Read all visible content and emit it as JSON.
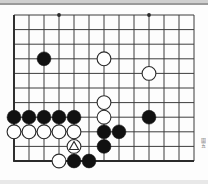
{
  "board": {
    "title": "Go board diagram",
    "type": "go-board-position",
    "cols": 13,
    "rows": 11,
    "origin_x": 14,
    "origin_y": 9,
    "spacing_x": 15,
    "spacing_y": 14.6,
    "bottom_edge_row": 10,
    "line_color": "#3d3d3d",
    "edge_color": "#2b2b2b",
    "black_color": "#111111",
    "white_color": "#ffffff",
    "white_border": "#2b2b2b",
    "board_color": "#fdfdfd",
    "star_points": [
      {
        "col": 3,
        "row": 0
      },
      {
        "col": 9,
        "row": 0
      }
    ],
    "stones": [
      {
        "col": 2,
        "row": 3,
        "color": "black",
        "mark": ""
      },
      {
        "col": 6,
        "row": 3,
        "color": "white",
        "mark": ""
      },
      {
        "col": 9,
        "row": 4,
        "color": "white",
        "mark": ""
      },
      {
        "col": 6,
        "row": 6,
        "color": "white",
        "mark": ""
      },
      {
        "col": 0,
        "row": 7,
        "color": "black",
        "mark": ""
      },
      {
        "col": 1,
        "row": 7,
        "color": "black",
        "mark": ""
      },
      {
        "col": 2,
        "row": 7,
        "color": "black",
        "mark": ""
      },
      {
        "col": 3,
        "row": 7,
        "color": "black",
        "mark": ""
      },
      {
        "col": 4,
        "row": 7,
        "color": "black",
        "mark": ""
      },
      {
        "col": 6,
        "row": 7,
        "color": "white",
        "mark": ""
      },
      {
        "col": 9,
        "row": 7,
        "color": "black",
        "mark": ""
      },
      {
        "col": 0,
        "row": 8,
        "color": "white",
        "mark": ""
      },
      {
        "col": 1,
        "row": 8,
        "color": "white",
        "mark": ""
      },
      {
        "col": 2,
        "row": 8,
        "color": "white",
        "mark": ""
      },
      {
        "col": 3,
        "row": 8,
        "color": "white",
        "mark": ""
      },
      {
        "col": 4,
        "row": 8,
        "color": "white",
        "mark": ""
      },
      {
        "col": 6,
        "row": 8,
        "color": "black",
        "mark": ""
      },
      {
        "col": 7,
        "row": 8,
        "color": "black",
        "mark": ""
      },
      {
        "col": 4,
        "row": 9,
        "color": "white",
        "mark": "triangle"
      },
      {
        "col": 6,
        "row": 9,
        "color": "black",
        "mark": ""
      },
      {
        "col": 3,
        "row": 10,
        "color": "white",
        "mark": ""
      },
      {
        "col": 4,
        "row": 10,
        "color": "black",
        "mark": ""
      },
      {
        "col": 5,
        "row": 10,
        "color": "black",
        "mark": ""
      }
    ]
  },
  "side_label": {
    "text": "圖五"
  }
}
